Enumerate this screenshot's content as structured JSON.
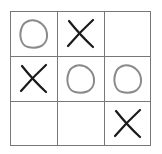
{
  "game": "tic-tac-toe",
  "colors": {
    "x": "#1a1a1a",
    "o": "#8a8a8a",
    "grid": "#777777"
  },
  "board": [
    [
      "O",
      "X",
      ""
    ],
    [
      "X",
      "O",
      "O"
    ],
    [
      "",
      "",
      "X"
    ]
  ]
}
